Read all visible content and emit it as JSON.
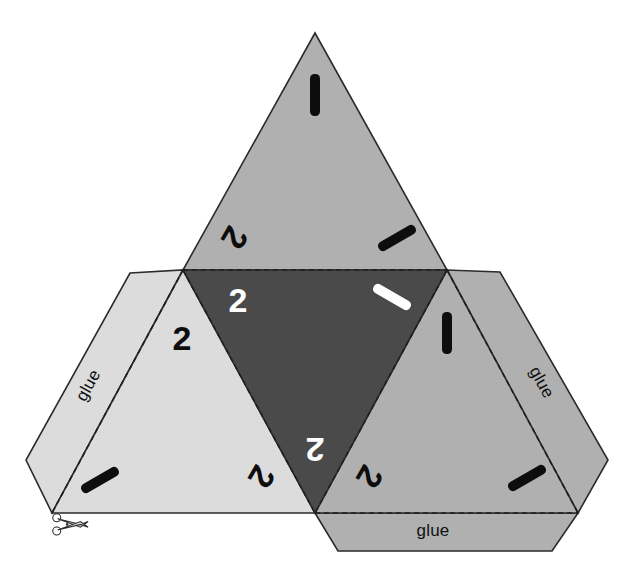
{
  "document": {
    "title": "Tetrahedron dice net",
    "background_color": "#ffffff"
  },
  "palette": {
    "face_top": "#b0b0b0",
    "face_center": "#4a4a4a",
    "face_left": "#dcdcdc",
    "face_right": "#b0b0b0",
    "outline": "#2b2b2b",
    "fold_line": "#1f1f1f",
    "pip_dark": "#0d0d0d",
    "pip_light": "#ffffff"
  },
  "faces": [
    {
      "id": "face-top",
      "name": "top-triangle",
      "fill": "#b0b0b0",
      "orientation": "upward",
      "points": "315,33 447,270 183,270",
      "marks": [
        {
          "type": "digit",
          "value": "1",
          "style": "bar",
          "color": "#0d0d0d",
          "x": 315,
          "y": 95,
          "rotate": 0
        },
        {
          "type": "digit",
          "value": "2",
          "style": "glyph",
          "color": "#0d0d0d",
          "x": 235,
          "y": 238,
          "rotate": 120
        },
        {
          "type": "digit",
          "value": "1",
          "style": "bar",
          "color": "#0d0d0d",
          "x": 397,
          "y": 238,
          "rotate": -120
        }
      ]
    },
    {
      "id": "face-center",
      "name": "center-triangle",
      "fill": "#4a4a4a",
      "orientation": "downward",
      "points": "183,270 447,270 315,513",
      "marks": [
        {
          "type": "digit",
          "value": "2",
          "style": "glyph",
          "color": "#ffffff",
          "x": 238,
          "y": 300,
          "rotate": 0
        },
        {
          "type": "digit",
          "value": "1",
          "style": "bar",
          "color": "#ffffff",
          "x": 392,
          "y": 297,
          "rotate": -60
        },
        {
          "type": "digit",
          "value": "2",
          "style": "glyph",
          "color": "#ffffff",
          "x": 315,
          "y": 450,
          "rotate": 180
        }
      ]
    },
    {
      "id": "face-left",
      "name": "left-triangle",
      "fill": "#dcdcdc",
      "orientation": "upward",
      "points": "183,270 315,513 52,513",
      "marks": [
        {
          "type": "digit",
          "value": "2",
          "style": "glyph",
          "color": "#0d0d0d",
          "x": 182,
          "y": 338,
          "rotate": 0
        },
        {
          "type": "digit",
          "value": "1",
          "style": "bar",
          "color": "#0d0d0d",
          "x": 100,
          "y": 480,
          "rotate": -120
        },
        {
          "type": "digit",
          "value": "2",
          "style": "glyph",
          "color": "#0d0d0d",
          "x": 262,
          "y": 477,
          "rotate": 120
        }
      ]
    },
    {
      "id": "face-right",
      "name": "right-triangle",
      "fill": "#b0b0b0",
      "orientation": "upward",
      "points": "447,270 578,513 315,513",
      "marks": [
        {
          "type": "digit",
          "value": "1",
          "style": "bar",
          "color": "#0d0d0d",
          "x": 447,
          "y": 333,
          "rotate": 0
        },
        {
          "type": "digit",
          "value": "2",
          "style": "glyph",
          "color": "#0d0d0d",
          "x": 370,
          "y": 477,
          "rotate": 120
        },
        {
          "type": "digit",
          "value": "1",
          "style": "bar",
          "color": "#0d0d0d",
          "x": 527,
          "y": 478,
          "rotate": -120
        }
      ]
    }
  ],
  "flaps": [
    {
      "id": "flap-left",
      "name": "glue-flap-left",
      "fill": "#dcdcdc",
      "label": "glue",
      "label_x": 93,
      "label_y": 388,
      "label_rotate": -61,
      "points": "183,270 52,513 26,460 130,273",
      "fold": "183,270 52,513"
    },
    {
      "id": "flap-right",
      "name": "glue-flap-right",
      "fill": "#b0b0b0",
      "label": "glue",
      "label_x": 537,
      "label_y": 385,
      "label_rotate": 61,
      "points": "447,270 578,513 608,460 500,272",
      "fold": "447,270 578,513"
    },
    {
      "id": "flap-bottom",
      "name": "glue-flap-bottom",
      "fill": "#b0b0b0",
      "label": "glue",
      "label_x": 433,
      "label_y": 536,
      "label_rotate": 0,
      "points": "315,513 578,513 552,551 338,551",
      "fold": "315,513 578,513"
    }
  ],
  "cut_marker": {
    "name": "scissors-icon",
    "x": 52,
    "y": 513,
    "label": "cut-here-scissors"
  }
}
